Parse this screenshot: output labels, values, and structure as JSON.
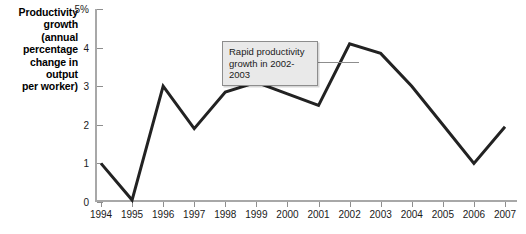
{
  "chart_data": {
    "type": "line",
    "title": "",
    "subtitle": "",
    "ylabel": "Productivity growth (annual percentage change in output per worker)",
    "xlabel": "",
    "categories": [
      "1994",
      "1995",
      "1996",
      "1997",
      "1998",
      "1999",
      "2000",
      "2001",
      "2002",
      "2003",
      "2004",
      "2005",
      "2006",
      "2007"
    ],
    "values": [
      1.0,
      0.05,
      3.0,
      1.9,
      2.85,
      3.1,
      2.8,
      2.5,
      4.1,
      3.85,
      3.0,
      2.0,
      1.0,
      1.95
    ],
    "series": [
      {
        "name": "Productivity growth",
        "values": [
          1.0,
          0.05,
          3.0,
          1.9,
          2.85,
          3.1,
          2.8,
          2.5,
          4.1,
          3.85,
          3.0,
          2.0,
          1.0,
          1.95
        ],
        "color": "#222222"
      }
    ],
    "ylim": [
      0,
      5
    ],
    "xlim": [
      "1994",
      "2007"
    ],
    "y_ticks": [
      0,
      1,
      2,
      3,
      4,
      5
    ],
    "y_tick_labels": [
      "0",
      "1",
      "2",
      "3",
      "4",
      "5%"
    ],
    "grid": false,
    "legend": null,
    "annotations": [
      {
        "text_line_1": "Rapid productivity",
        "text_line_2": "growth in 2002-2003",
        "points_to_year": "2002"
      }
    ]
  },
  "axis": {
    "y_title_lines": [
      "Productivity",
      "growth",
      "(annual",
      "percentage",
      "change in",
      "output",
      "per worker)"
    ]
  },
  "colors": {
    "line": "#222222",
    "axis": "#a8a8a8",
    "tick": "#8e8e8e",
    "callout_fill": "#e9e9e9",
    "callout_border": "#8d8d8d",
    "text": "#1a1a1a",
    "background": "#ffffff"
  }
}
